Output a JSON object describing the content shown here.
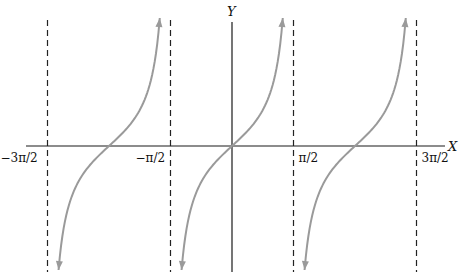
{
  "chart_data": {
    "type": "line",
    "title": "",
    "function": "y = tan(x)",
    "xlabel": "X",
    "ylabel": "Y",
    "xlim": [
      -4.95,
      5.62
    ],
    "ylim": [
      -3.5,
      3.5
    ],
    "grid": false,
    "legend": "none",
    "x_ticks": [
      {
        "value": -4.712389,
        "label": "−3π/2"
      },
      {
        "value": -1.570796,
        "label": "−π/2"
      },
      {
        "value": 1.570796,
        "label": "π/2"
      },
      {
        "value": 4.712389,
        "label": "3π/2"
      }
    ],
    "asymptotes": [
      -4.712389,
      -1.570796,
      1.570796,
      4.712389
    ],
    "series": [
      {
        "name": "branch-left",
        "x_range": [
          -4.712389,
          -1.570796
        ],
        "center": -3.141593
      },
      {
        "name": "branch-middle",
        "x_range": [
          -1.570796,
          1.570796
        ],
        "center": 0
      },
      {
        "name": "branch-right",
        "x_range": [
          1.570796,
          4.712389
        ],
        "center": 3.141593
      }
    ],
    "colors": {
      "curve": "#9a9a9a",
      "axes": "#1a1a1a",
      "asymptote": "#222222"
    }
  }
}
